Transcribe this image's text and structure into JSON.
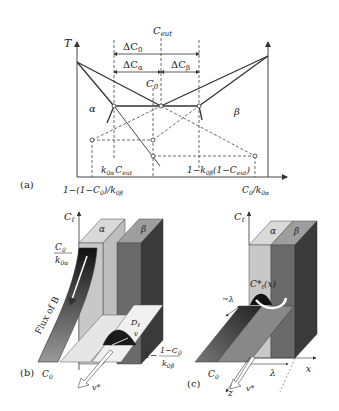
{
  "panel_a": {
    "tag": "(a)",
    "axis_t": "T",
    "c_eut_top": "C",
    "c_eut_top_sub": "eut",
    "delta_c0": "ΔC",
    "delta_c0_sub": "0",
    "delta_ca": "ΔC",
    "delta_ca_sub": "α",
    "delta_cb": "ΔC",
    "delta_cb_sub": "β",
    "c0": "C",
    "c0_sub": "0",
    "alpha": "α",
    "beta": "β",
    "k_ceut": "k",
    "k_ceut_sub": "0α",
    "k_ceut_c": "C",
    "k_ceut_c_sub": "eut",
    "right_label": "1−k",
    "right_label_sub": "0β",
    "right_label_tail": "(1−C",
    "right_label_tail_sub": "eut",
    "right_label_end": ")",
    "bottom_left": "1−(1−C",
    "bottom_left_sub": "0",
    "bottom_left_tail": ")/k",
    "bottom_left_tail_sub": "0β",
    "bottom_right": "C",
    "bottom_right_sub": "0",
    "bottom_right_tail": "/k",
    "bottom_right_tail_sub": "0α"
  },
  "panel_b": {
    "tag": "(b)",
    "axis_cl": "C",
    "axis_cl_sub": "ℓ",
    "alpha": "α",
    "beta": "β",
    "frac_top_num": "C",
    "frac_top_num_sub": "0",
    "frac_top_den": "k",
    "frac_top_den_sub": "0α",
    "flux": "Flux of B",
    "dl_num": "D",
    "dl_num_sub": "ℓ",
    "dl_den": "v",
    "c0": "C",
    "c0_sub": "0",
    "right_prefix": "1−",
    "right_num": "1−C",
    "right_num_sub": "0",
    "right_den": "k",
    "right_den_sub": "0β",
    "velocity": "v*"
  },
  "panel_c": {
    "tag": "(c)",
    "axis_cl": "C",
    "axis_cl_sub": "ℓ",
    "alpha": "α",
    "beta": "β",
    "cl_star": "C*",
    "cl_star_sub": "ℓ",
    "cl_star_arg": "(x)",
    "lambda_approx": "~λ",
    "c0": "C",
    "c0_sub": "0",
    "x_axis": "x",
    "z_axis": "z",
    "lambda": "λ",
    "velocity": "v*"
  }
}
